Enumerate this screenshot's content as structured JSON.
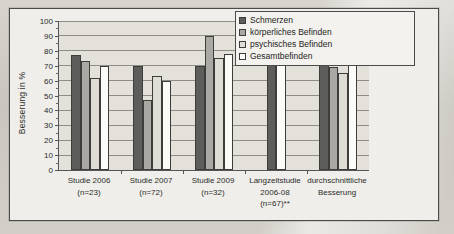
{
  "chart_data": {
    "type": "bar",
    "title": "",
    "xlabel": "",
    "ylabel": "Besserung in %",
    "ylim": [
      0,
      100
    ],
    "ytick_step": 10,
    "yticks": [
      0,
      10,
      20,
      30,
      40,
      50,
      60,
      70,
      80,
      90,
      100
    ],
    "grid": true,
    "legend_position": "top-right",
    "categories": [
      "Studie 2006\n(n=23)",
      "Studie 2007\n(n=72)",
      "Studie 2009\n(n=32)",
      "Langzeitstudie\n2006-08\n(n=67)**",
      "durchschnittliche\nBesserung"
    ],
    "series": [
      {
        "name": "Schmerzen",
        "values": [
          77,
          70,
          70,
          81,
          74
        ]
      },
      {
        "name": "körperliches Befinden",
        "values": [
          73,
          47,
          90,
          null,
          69
        ]
      },
      {
        "name": "psychisches Befinden",
        "values": [
          62,
          63,
          75,
          null,
          65
        ]
      },
      {
        "name": "Gesamtbefinden",
        "values": [
          70,
          60,
          78,
          76,
          71
        ]
      }
    ]
  },
  "chart": {
    "y_axis": {
      "title": "Besserung in %",
      "ticks": [
        "100",
        "90",
        "80",
        "70",
        "60",
        "50",
        "40",
        "30",
        "20",
        "10",
        "0"
      ]
    },
    "categories": [
      {
        "line1": "Studie 2006",
        "line2": "(n=23)",
        "line3": ""
      },
      {
        "line1": "Studie 2007",
        "line2": "(n=72)",
        "line3": ""
      },
      {
        "line1": "Studie 2009",
        "line2": "(n=32)",
        "line3": ""
      },
      {
        "line1": "Langzeitstudie",
        "line2": "2006-08",
        "line3": "(n=67)**"
      },
      {
        "line1": "durchschnittliche",
        "line2": "Besserung",
        "line3": ""
      }
    ],
    "legend": [
      {
        "label": "Schmerzen",
        "color": "#5d5d5b"
      },
      {
        "label": "körperliches Befinden",
        "color": "#a9a8a3"
      },
      {
        "label": "psychisches Befinden",
        "color": "#dedcd5"
      },
      {
        "label": "Gesamtbefinden",
        "color": "#fbfbf8"
      }
    ]
  }
}
